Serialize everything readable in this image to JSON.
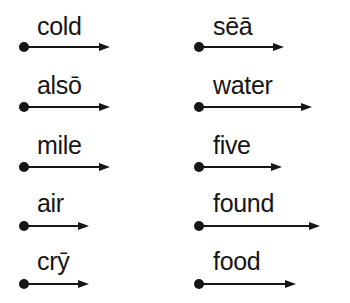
{
  "worksheet": {
    "columns": [
      {
        "items": [
          {
            "word": "cold",
            "arrow_length": 86
          },
          {
            "word": "alsō",
            "arrow_length": 86
          },
          {
            "word": "mile",
            "arrow_length": 86
          },
          {
            "word": "air",
            "arrow_length": 65
          },
          {
            "word": "crȳ",
            "arrow_length": 65
          }
        ]
      },
      {
        "items": [
          {
            "word": "sēā",
            "arrow_length": 85
          },
          {
            "word": "water",
            "arrow_length": 113
          },
          {
            "word": "five",
            "arrow_length": 83
          },
          {
            "word": "found",
            "arrow_length": 121
          },
          {
            "word": "food",
            "arrow_length": 97
          }
        ]
      }
    ],
    "colors": {
      "ink": "#161616",
      "background": "#ffffff"
    }
  }
}
